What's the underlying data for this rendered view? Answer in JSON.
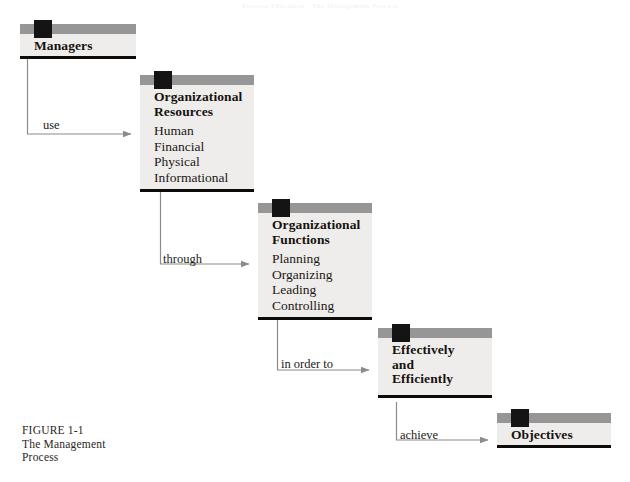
{
  "figure": {
    "scan_artifact_text": "Pearson Education  ·  The Management Process",
    "caption_lines": [
      "FIGURE 1-1",
      "The Management",
      "Process"
    ],
    "colors": {
      "header_bar": "#969696",
      "knob": "#141414",
      "box_body": "#eeedeb",
      "bottom_rule": "#0d0b0a",
      "connector": "#8e8a87",
      "text": "#17120f",
      "page_background": "#ffffff"
    },
    "nodes": [
      {
        "id": "managers",
        "title": "Managers",
        "items": [],
        "x": 20,
        "y": 24,
        "width": 116
      },
      {
        "id": "organizational-resources",
        "title": "Organizational\nResources",
        "title_lines": [
          "Organizational",
          "Resources"
        ],
        "items": [
          "Human",
          "Financial",
          "Physical",
          "Informational"
        ],
        "x": 140,
        "y": 75,
        "width": 114
      },
      {
        "id": "organizational-functions",
        "title": "Organizational\nFunctions",
        "title_lines": [
          "Organizational",
          "Functions"
        ],
        "items": [
          "Planning",
          "Organizing",
          "Leading",
          "Controlling"
        ],
        "x": 258,
        "y": 203,
        "width": 114
      },
      {
        "id": "effectively-and-efficiently",
        "title": "Effectively\nand\nEfficiently",
        "title_lines": [
          "Effectively",
          "and",
          "Efficiently"
        ],
        "items": [],
        "x": 378,
        "y": 328,
        "width": 114
      },
      {
        "id": "objectives",
        "title": "Objectives",
        "title_lines": [
          "Objectives"
        ],
        "items": [],
        "x": 497,
        "y": 413,
        "width": 114
      }
    ],
    "connectors": [
      {
        "id": "use",
        "label": "use",
        "from": "managers",
        "to": "organizational-resources",
        "label_x": 43,
        "label_y": 118
      },
      {
        "id": "through",
        "label": "through",
        "from": "organizational-resources",
        "to": "organizational-functions",
        "label_x": 163,
        "label_y": 252
      },
      {
        "id": "in-order-to",
        "label": "in order to",
        "from": "organizational-functions",
        "to": "effectively-and-efficiently",
        "label_x": 281,
        "label_y": 357
      },
      {
        "id": "achieve",
        "label": "achieve",
        "from": "effectively-and-efficiently",
        "to": "objectives",
        "label_x": 400,
        "label_y": 428
      }
    ]
  }
}
